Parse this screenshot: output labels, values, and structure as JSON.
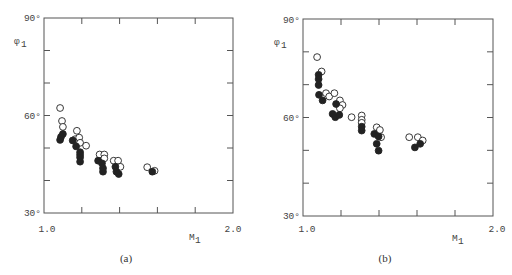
{
  "chart_data": [
    {
      "type": "scatter",
      "panel": "(a)",
      "title": "",
      "xlabel": "M1",
      "ylabel": "φ1",
      "xlim": [
        1.0,
        2.0
      ],
      "ylim": [
        30,
        90
      ],
      "x_tick_labels": [
        "1.0",
        "2.0"
      ],
      "y_tick_labels": [
        "30°",
        "60°",
        "90°"
      ],
      "x_minor_ticks": [
        1.2,
        1.4,
        1.6,
        1.8
      ],
      "y_minor_ticks": [
        40,
        50,
        70,
        80
      ],
      "grid": false,
      "legend": null,
      "series": [
        {
          "name": "open",
          "marker": "open-circle",
          "points": [
            [
              1.085,
              62.3
            ],
            [
              1.095,
              58.3
            ],
            [
              1.1,
              56.5
            ],
            [
              1.165,
              52.7
            ],
            [
              1.174,
              55.3
            ],
            [
              1.186,
              53.2
            ],
            [
              1.191,
              51.6
            ],
            [
              1.223,
              50.7
            ],
            [
              1.294,
              48.0
            ],
            [
              1.319,
              48.0
            ],
            [
              1.319,
              46.8
            ],
            [
              1.369,
              46.1
            ],
            [
              1.392,
              46.1
            ],
            [
              1.404,
              44.2
            ],
            [
              1.546,
              44.1
            ],
            [
              1.585,
              43.0
            ]
          ]
        },
        {
          "name": "filled",
          "marker": "filled-circle",
          "points": [
            [
              1.1,
              54.3
            ],
            [
              1.09,
              53.4
            ],
            [
              1.085,
              52.5
            ],
            [
              1.152,
              52.3
            ],
            [
              1.17,
              50.5
            ],
            [
              1.191,
              48.7
            ],
            [
              1.191,
              47.9
            ],
            [
              1.191,
              47.1
            ],
            [
              1.191,
              45.8
            ],
            [
              1.286,
              46.1
            ],
            [
              1.307,
              45.3
            ],
            [
              1.312,
              43.8
            ],
            [
              1.312,
              42.7
            ],
            [
              1.378,
              44.2
            ],
            [
              1.383,
              42.7
            ],
            [
              1.395,
              42.0
            ],
            [
              1.573,
              42.7
            ]
          ]
        }
      ]
    },
    {
      "type": "scatter",
      "panel": "(b)",
      "title": "",
      "xlabel": "M1",
      "ylabel": "φ1",
      "xlim": [
        1.0,
        2.0
      ],
      "ylim": [
        30,
        90
      ],
      "x_tick_labels": [
        "1.0",
        "2.0"
      ],
      "y_tick_labels": [
        "30°",
        "60°",
        "90°"
      ],
      "x_minor_ticks": [
        1.2,
        1.4,
        1.6,
        1.8
      ],
      "y_minor_ticks": [
        40,
        50,
        70,
        80
      ],
      "grid": false,
      "legend": null,
      "series": [
        {
          "name": "open",
          "marker": "open-circle",
          "points": [
            [
              1.074,
              78.4
            ],
            [
              1.098,
              74.0
            ],
            [
              1.121,
              67.4
            ],
            [
              1.138,
              66.4
            ],
            [
              1.165,
              67.4
            ],
            [
              1.194,
              65.2
            ],
            [
              1.208,
              63.8
            ],
            [
              1.194,
              62.8
            ],
            [
              1.256,
              60.1
            ],
            [
              1.309,
              60.6
            ],
            [
              1.309,
              59.3
            ],
            [
              1.309,
              58.4
            ],
            [
              1.388,
              57.0
            ],
            [
              1.405,
              56.2
            ],
            [
              1.411,
              54.0
            ],
            [
              1.559,
              54.0
            ],
            [
              1.604,
              54.0
            ],
            [
              1.63,
              53.0
            ]
          ]
        },
        {
          "name": "filled",
          "marker": "filled-circle",
          "points": [
            [
              1.082,
              73.0
            ],
            [
              1.082,
              71.7
            ],
            [
              1.082,
              69.9
            ],
            [
              1.084,
              66.9
            ],
            [
              1.103,
              65.2
            ],
            [
              1.174,
              64.1
            ],
            [
              1.156,
              61.1
            ],
            [
              1.17,
              60.1
            ],
            [
              1.191,
              60.8
            ],
            [
              1.309,
              57.2
            ],
            [
              1.309,
              56.0
            ],
            [
              1.375,
              55.0
            ],
            [
              1.398,
              54.2
            ],
            [
              1.388,
              52.0
            ],
            [
              1.398,
              49.9
            ],
            [
              1.589,
              50.9
            ],
            [
              1.617,
              52.0
            ]
          ]
        }
      ]
    }
  ],
  "panels": [
    {
      "label": "(a)",
      "y_axis_title": "φ",
      "y_axis_sub": "1",
      "x_axis_title": "M",
      "x_axis_sub": "1",
      "y_top_label": "90°",
      "y_mid_label": "60°",
      "y_bottom_label": "30°",
      "x_left_label": "1.0",
      "x_right_label": "2.0"
    },
    {
      "label": "(b)",
      "y_axis_title": "φ",
      "y_axis_sub": "1",
      "x_axis_title": "M",
      "x_axis_sub": "1",
      "y_top_label": "90°",
      "y_mid_label": "60°",
      "y_bottom_label": "30°",
      "x_left_label": "1.0",
      "x_right_label": "2.0"
    }
  ],
  "colors": {
    "axis": "#555555",
    "marker": "#222222",
    "background": "#ffffff"
  }
}
